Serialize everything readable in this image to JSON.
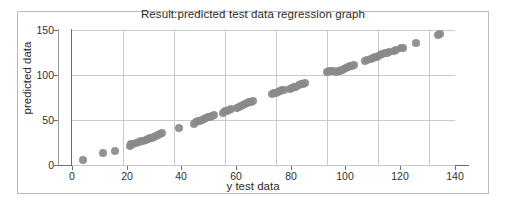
{
  "chart_data": {
    "type": "scatter",
    "title": "Result:predicted test data regression graph",
    "xlabel": "y test data",
    "ylabel": "predicted data",
    "xlim": [
      0,
      150
    ],
    "ylim": [
      0,
      150
    ],
    "xticks": [
      0,
      20,
      40,
      60,
      80,
      100,
      120,
      140
    ],
    "yticks": [
      0,
      50,
      100,
      150
    ],
    "grid": true,
    "legend": "none",
    "marker_color": "#8a8a8a",
    "marker_size": 8,
    "series": [
      {
        "name": "predicted vs actual",
        "points": [
          [
            4.2,
            5.5
          ],
          [
            12.0,
            13.0
          ],
          [
            16.8,
            16.0
          ],
          [
            22.6,
            21.0
          ],
          [
            23.2,
            23.0
          ],
          [
            24.0,
            23.8
          ],
          [
            25.2,
            25.0
          ],
          [
            26.4,
            25.6
          ],
          [
            27.2,
            26.5
          ],
          [
            28.0,
            27.2
          ],
          [
            28.8,
            28.0
          ],
          [
            29.6,
            28.8
          ],
          [
            30.4,
            29.5
          ],
          [
            31.2,
            30.5
          ],
          [
            32.0,
            31.5
          ],
          [
            32.8,
            32.5
          ],
          [
            33.6,
            33.5
          ],
          [
            34.4,
            34.5
          ],
          [
            35.2,
            35.5
          ],
          [
            42.0,
            41.5
          ],
          [
            47.6,
            46.0
          ],
          [
            48.4,
            47.5
          ],
          [
            49.2,
            48.5
          ],
          [
            50.0,
            49.2
          ],
          [
            50.8,
            50.0
          ],
          [
            51.6,
            50.8
          ],
          [
            52.4,
            51.8
          ],
          [
            53.2,
            52.8
          ],
          [
            54.0,
            53.8
          ],
          [
            54.8,
            54.8
          ],
          [
            55.6,
            55.5
          ],
          [
            59.0,
            58.0
          ],
          [
            60.0,
            59.5
          ],
          [
            60.8,
            60.5
          ],
          [
            61.6,
            61.5
          ],
          [
            62.4,
            62.5
          ],
          [
            64.6,
            63.0
          ],
          [
            65.4,
            64.5
          ],
          [
            66.2,
            65.5
          ],
          [
            67.0,
            66.5
          ],
          [
            67.8,
            67.5
          ],
          [
            68.6,
            68.5
          ],
          [
            69.4,
            69.5
          ],
          [
            70.2,
            70.5
          ],
          [
            71.0,
            71.2
          ],
          [
            78.2,
            79.0
          ],
          [
            79.0,
            79.8
          ],
          [
            79.8,
            80.5
          ],
          [
            80.6,
            81.2
          ],
          [
            81.4,
            82.0
          ],
          [
            82.2,
            82.8
          ],
          [
            83.0,
            83.5
          ],
          [
            85.4,
            84.5
          ],
          [
            86.2,
            85.5
          ],
          [
            87.0,
            86.5
          ],
          [
            87.8,
            87.2
          ],
          [
            89.0,
            88.5
          ],
          [
            89.8,
            89.5
          ],
          [
            90.6,
            90.5
          ],
          [
            91.4,
            91.5
          ],
          [
            100.0,
            103.5
          ],
          [
            100.8,
            104.2
          ],
          [
            101.6,
            104.5
          ],
          [
            102.4,
            104.8
          ],
          [
            103.2,
            103.5
          ],
          [
            104.0,
            104.0
          ],
          [
            104.8,
            104.8
          ],
          [
            105.6,
            105.5
          ],
          [
            106.4,
            106.5
          ],
          [
            107.2,
            107.5
          ],
          [
            108.0,
            108.5
          ],
          [
            108.8,
            109.5
          ],
          [
            109.6,
            110.5
          ],
          [
            110.4,
            111.2
          ],
          [
            114.8,
            116.0
          ],
          [
            115.6,
            116.8
          ],
          [
            117.0,
            118.0
          ],
          [
            117.8,
            118.8
          ],
          [
            118.6,
            119.5
          ],
          [
            119.4,
            120.2
          ],
          [
            120.8,
            122.0
          ],
          [
            121.6,
            123.0
          ],
          [
            122.4,
            124.0
          ],
          [
            123.2,
            125.0
          ],
          [
            124.0,
            125.8
          ],
          [
            126.2,
            127.0
          ],
          [
            127.0,
            127.5
          ],
          [
            129.0,
            129.5
          ],
          [
            129.8,
            130.5
          ],
          [
            134.6,
            135.5
          ],
          [
            143.4,
            145.0
          ],
          [
            144.2,
            146.0
          ]
        ]
      }
    ]
  },
  "axes": {
    "ytick_labels": [
      "150",
      "100",
      "50",
      "0"
    ],
    "xtick_labels": [
      "0",
      "20",
      "40",
      "60",
      "80",
      "100",
      "120",
      "140"
    ]
  }
}
